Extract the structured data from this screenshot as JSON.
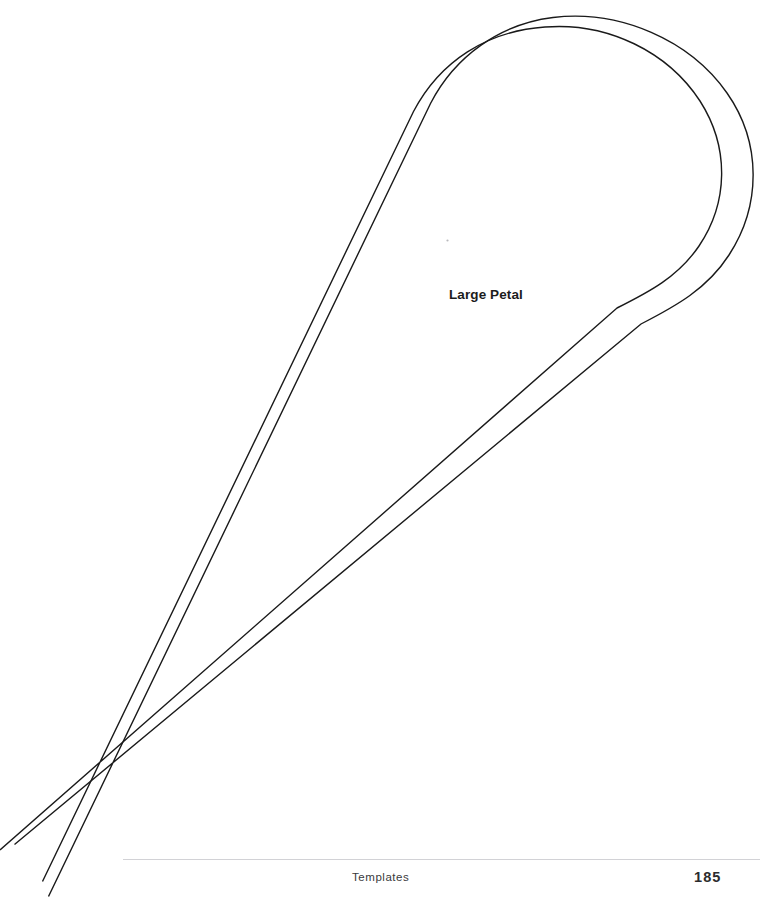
{
  "page": {
    "background_color": "#ffffff",
    "width": 780,
    "height": 924
  },
  "template": {
    "piece_label": "Large Petal",
    "line_color": "#1a1a1a",
    "outline_name": "large-petal-cut-line",
    "seam_name": "large-petal-seam-line",
    "description": "Teardrop shaped sewing/craft template with outer cutting line and inner seam allowance line tapering to a point at lower left"
  },
  "footer": {
    "section_label": "Templates",
    "page_number": "185",
    "rule_color": "#d2d2d6"
  }
}
